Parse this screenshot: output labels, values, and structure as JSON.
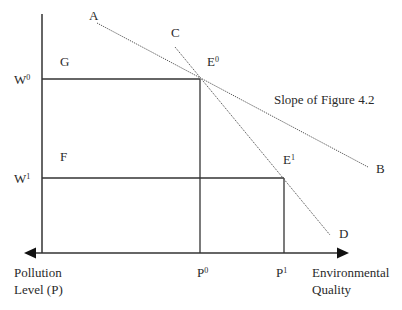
{
  "diagram": {
    "y_axis_labels": {
      "w0": {
        "base": "W",
        "sup": "0"
      },
      "w1": {
        "base": "W",
        "sup": "1"
      }
    },
    "x_axis_labels": {
      "p0": {
        "base": "P",
        "sup": "0"
      },
      "p1": {
        "base": "P",
        "sup": "1"
      }
    },
    "region_labels": {
      "g": "G",
      "f": "F"
    },
    "line_labels": {
      "a": "A",
      "b": "B",
      "c": "C",
      "d": "D"
    },
    "points": {
      "e0": {
        "base": "E",
        "sup": "0"
      },
      "e1": {
        "base": "E",
        "sup": "1"
      }
    },
    "annotation": "Slope of Figure 4.2",
    "axis_left_label": {
      "line1": "Pollution",
      "line2": "Level (P)"
    },
    "axis_right_label": {
      "line1": "Environmental",
      "line2": "Quality"
    },
    "colors": {
      "axis": "#333333",
      "dotted_line": "#555555",
      "background": "#ffffff"
    }
  }
}
